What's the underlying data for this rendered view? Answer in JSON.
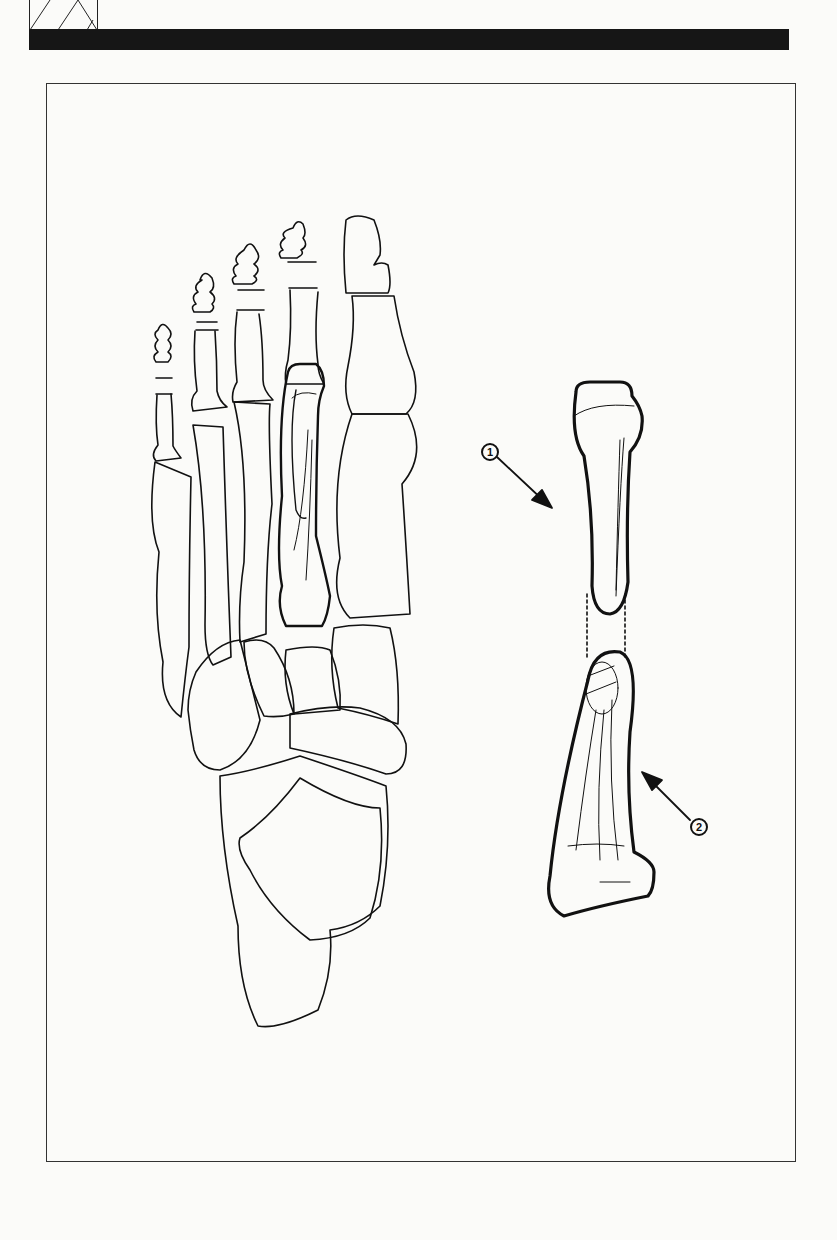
{
  "figure": {
    "callouts": [
      {
        "number": "1",
        "target": "proximal fragment of metatarsal shaft"
      },
      {
        "number": "2",
        "target": "distal fragment of metatarsal shaft"
      }
    ],
    "colors": {
      "ink": "#111111",
      "paper": "#fbfbf9",
      "header_bar": "#161616"
    }
  }
}
